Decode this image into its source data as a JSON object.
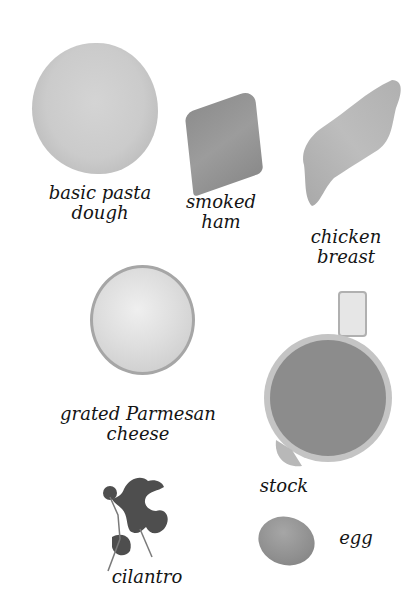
{
  "ingredients": [
    {
      "id": "pasta-dough",
      "label": "basic pasta\ndough"
    },
    {
      "id": "smoked-ham",
      "label": "smoked\nham"
    },
    {
      "id": "chicken-breast",
      "label": "chicken\nbreast"
    },
    {
      "id": "parmesan",
      "label": "grated Parmesan\ncheese"
    },
    {
      "id": "stock",
      "label": "stock"
    },
    {
      "id": "cilantro",
      "label": "cilantro"
    },
    {
      "id": "egg",
      "label": "egg"
    }
  ]
}
